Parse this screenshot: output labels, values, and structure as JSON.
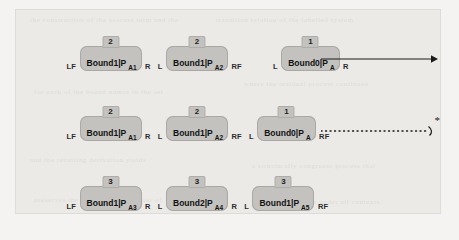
{
  "figure": {
    "background_color": "#eceae7",
    "node_fill": "#c3c2bf",
    "ink_color": "#111111"
  },
  "rows": [
    {
      "id": "row-1",
      "groups": [
        {
          "left_port": "LF",
          "tab": "2",
          "label": "Bound1|P",
          "subscript": "A1",
          "right_port": "R"
        },
        {
          "left_port": "L",
          "tab": "2",
          "label": "Bound1|P",
          "subscript": "A2",
          "right_port": "RF"
        },
        {
          "left_port": "L",
          "tab": "1",
          "label": "Bound0|P",
          "subscript": "A",
          "right_port": "R"
        }
      ],
      "arrow": {
        "style": "solid",
        "marker": ""
      }
    },
    {
      "id": "row-2",
      "groups": [
        {
          "left_port": "LF",
          "tab": "2",
          "label": "Bound1|P",
          "subscript": "A1",
          "right_port": "R"
        },
        {
          "left_port": "L",
          "tab": "2",
          "label": "Bound1|P",
          "subscript": "A2",
          "right_port": "RF"
        },
        {
          "left_port": "L",
          "tab": "1",
          "label": "Bound0|P",
          "subscript": "A",
          "right_port": "RF"
        }
      ],
      "arrow": {
        "style": "dotted",
        "marker": "*"
      }
    },
    {
      "id": "row-3",
      "groups": [
        {
          "left_port": "LF",
          "tab": "3",
          "label": "Bound1|P",
          "subscript": "A3",
          "right_port": "R"
        },
        {
          "left_port": "L",
          "tab": "3",
          "label": "Bound2|P",
          "subscript": "A4",
          "right_port": "R"
        },
        {
          "left_port": "L",
          "tab": "3",
          "label": "Bound1|P",
          "subscript": "A5",
          "right_port": "RF"
        }
      ],
      "arrow": null
    }
  ],
  "ghost_text": [
    "the construction of the process term and the",
    "transition relation of the labelled system",
    "for each of the bound names in the set",
    "where the residual process continues",
    "and the resulting derivation yields",
    "a structurally congruent process that",
    "preserves the observable behaviour of",
    "the original term under all contexts."
  ]
}
